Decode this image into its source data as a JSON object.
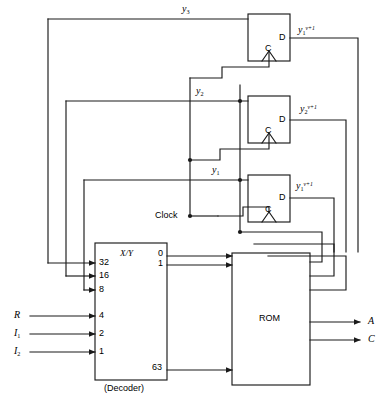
{
  "diagram": {
    "caption": "",
    "stroke_color": "#1a1a1a",
    "background": "#ffffff"
  },
  "blocks": {
    "decoder": {
      "name": "Decoder",
      "caption": "(Decoder)",
      "function_label": "X/Y",
      "inputs": [
        {
          "weight": "32",
          "source": "y3"
        },
        {
          "weight": "16",
          "source": "y2"
        },
        {
          "weight": "8",
          "source": "y1"
        },
        {
          "weight": "4",
          "source": "R"
        },
        {
          "weight": "2",
          "source": "I1"
        },
        {
          "weight": "1",
          "source": "I2"
        }
      ],
      "outputs": [
        {
          "index": "0"
        },
        {
          "index": "1"
        },
        {
          "index": "63"
        }
      ]
    },
    "rom": {
      "name": "ROM",
      "label": "ROM"
    },
    "flipflops": [
      {
        "id": "ff3",
        "data_label": "D",
        "clock_label": "C",
        "input_signal": "y3",
        "output_signal_base": "y",
        "output_signal_sub": "1",
        "output_signal_sup": "v+1"
      },
      {
        "id": "ff2",
        "data_label": "D",
        "clock_label": "C",
        "input_signal": "y2",
        "output_signal_base": "y",
        "output_signal_sub": "2",
        "output_signal_sup": "v+1"
      },
      {
        "id": "ff1",
        "data_label": "D",
        "clock_label": "C",
        "input_signal": "y1",
        "output_signal_base": "y",
        "output_signal_sub": "1",
        "output_signal_sup": "v+1"
      }
    ]
  },
  "signals": {
    "feedback": [
      {
        "name": "y3",
        "base": "y",
        "sub": "3"
      },
      {
        "name": "y2",
        "base": "y",
        "sub": "2"
      },
      {
        "name": "y1",
        "base": "y",
        "sub": "1"
      }
    ],
    "external_inputs": [
      {
        "name": "R",
        "base": "R",
        "sub": ""
      },
      {
        "name": "I1",
        "base": "I",
        "sub": "1"
      },
      {
        "name": "I2",
        "base": "I",
        "sub": "2"
      }
    ],
    "clock": {
      "label": "Clock"
    },
    "outputs": [
      {
        "name": "A",
        "base": "A"
      },
      {
        "name": "C",
        "base": "C"
      }
    ]
  }
}
